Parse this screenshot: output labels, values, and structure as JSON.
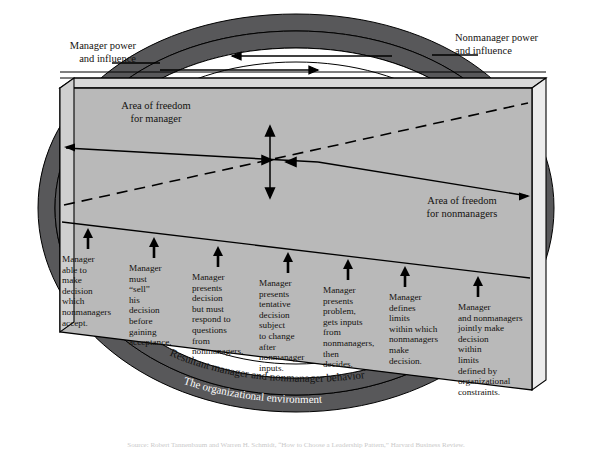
{
  "figure": {
    "type": "diagram",
    "labels": {
      "manager_power": "Manager power\nand influence",
      "nonmanager_power": "Nonmanager power\nand influence",
      "area_freedom_manager": "Area of freedom\nfor manager",
      "area_freedom_nonmanager": "Area of freedom\nfor nonmanagers"
    },
    "bands": [
      {
        "id": "resultant",
        "label": "Resultant manager and nonmanager behavior",
        "fill": "#ffffff"
      },
      {
        "id": "organizational",
        "label": "The organizational environment",
        "fill": "#58585a"
      },
      {
        "id": "societal",
        "label": "The societal environment",
        "fill": "#58585a"
      }
    ],
    "columns": [
      {
        "index": 1,
        "text": "Manager\nable to\nmake\ndecision\nwhich\nnonmanagers\naccept."
      },
      {
        "index": 2,
        "text": "Manager\nmust\n“sell”\nhis\ndecision\nbefore\ngaining\nacceptance."
      },
      {
        "index": 3,
        "text": "Manager\npresents\ndecision\nbut must\nrespond to\nquestions\nfrom\nnonmanagers."
      },
      {
        "index": 4,
        "text": "Manager\npresents\ntentative\ndecision\nsubject\nto change\nafter\nnonmanager\ninputs."
      },
      {
        "index": 5,
        "text": "Manager\npresents\nproblem,\ngets inputs\nfrom\nnonmanagers,\nthen\ndecides."
      },
      {
        "index": 6,
        "text": "Manager\ndefines\nlimits\nwithin which\nnonmanagers\nmake\ndecision."
      },
      {
        "index": 7,
        "text": "Manager\nand nonmanagers\njointly make\ndecision\nwithin\nlimits\ndefined by\norganizational\nconstraints."
      }
    ],
    "colors": {
      "band_dark": "#58585a",
      "box_face": "#b9b9b9",
      "box_top": "#d7d7d7",
      "box_side": "#cfcfcf",
      "outline": "#000000",
      "page_background": "#ffffff"
    },
    "source": "Source: Robert Tannenbaum and Warren H. Schmidt, “How to Choose a Leadership Pattern,” Harvard Business Review."
  }
}
